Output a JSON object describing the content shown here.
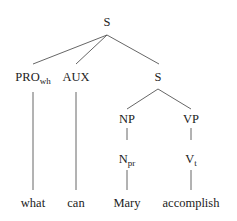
{
  "tree": {
    "root": "S",
    "nodes": {
      "s_top": "S",
      "pro_base": "PRO",
      "pro_sub": "wh",
      "aux": "AUX",
      "s_inner": "S",
      "np": "NP",
      "vp": "VP",
      "npr_base": "N",
      "npr_sub": "pr",
      "vt_base": "V",
      "vt_sub": "t"
    },
    "leaves": [
      "what",
      "can",
      "Mary",
      "accomplish"
    ]
  }
}
